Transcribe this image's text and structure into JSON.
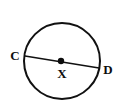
{
  "figure": {
    "background_color": "#ffffff",
    "stroke_color": "#111111",
    "width": 118,
    "height": 107
  },
  "circle": {
    "name": "circle-X",
    "center_x": 62,
    "center_y": 61,
    "radius": 38,
    "stroke_width": 2,
    "stroke_color": "#111111",
    "fill": "none"
  },
  "center_point": {
    "name": "center-dot",
    "x": 61,
    "y": 61,
    "radius": 3.2,
    "fill": "#0d0d0d"
  },
  "segment": {
    "name": "diameter-CD",
    "x1": 25,
    "y1": 56,
    "x2": 99,
    "y2": 68,
    "stroke_width": 1.6,
    "stroke_color": "#111111"
  },
  "labels": {
    "left": {
      "text": "C",
      "x": 15,
      "y": 60,
      "anchor": "middle"
    },
    "center": {
      "text": "X",
      "x": 62,
      "y": 78,
      "anchor": "middle"
    },
    "right": {
      "text": "D",
      "x": 108,
      "y": 74,
      "anchor": "middle"
    }
  }
}
